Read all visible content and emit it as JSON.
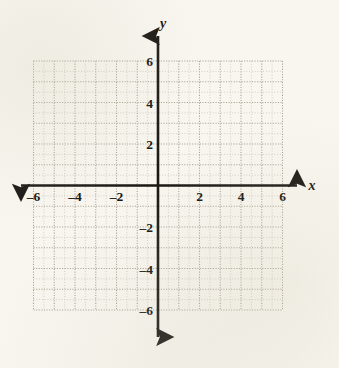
{
  "figure": {
    "name": "blank-coordinate-plane",
    "background_color": "#f8f6ef",
    "axis_color": "#1a1713",
    "grid_major_color": "#a9a293",
    "grid_minor_color": "#cac4b4"
  },
  "axis_names": {
    "x": "x",
    "y": "y"
  },
  "chart_data": {
    "type": "scatter",
    "title": "",
    "subtitle": "",
    "xlabel": "x",
    "ylabel": "y",
    "xlim": [
      -6,
      6
    ],
    "ylim": [
      -6,
      6
    ],
    "x_ticks": [
      -6,
      -4,
      -2,
      2,
      4,
      6
    ],
    "y_ticks": [
      6,
      4,
      2,
      -2,
      -4,
      -6
    ],
    "x_tick_labels": [
      "–6",
      "–4",
      "–2",
      "2",
      "4",
      "6"
    ],
    "y_tick_labels": [
      "6",
      "4",
      "2",
      "–2",
      "–4",
      "–6"
    ],
    "minor_tick_step": 0.5,
    "major_tick_step": 1,
    "grid": true,
    "grid_style": "dotted",
    "legend": null,
    "series": [],
    "annotations": []
  }
}
